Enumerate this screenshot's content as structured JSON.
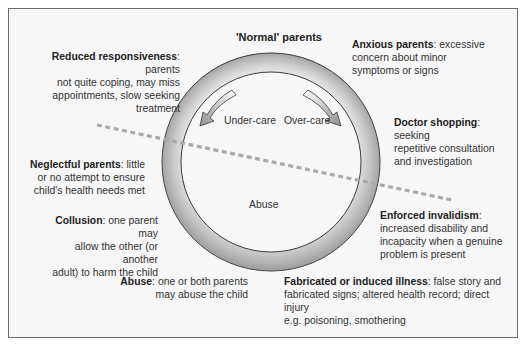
{
  "diagram": {
    "top_title": "'Normal' parents",
    "arrows": {
      "under_care": "Under-care",
      "over_care": "Over-care"
    },
    "center_label": "Abuse",
    "boxes": [
      {
        "id": "reduced",
        "title": "Reduced responsiveness",
        "text": ": parents not quite coping, may miss appointments, slow seeking treatment",
        "lines": [
          "not quite coping, may miss",
          "appointments, slow seeking treatment"
        ],
        "first_line_rest": ": parents"
      },
      {
        "id": "anxious",
        "title": "Anxious parents",
        "first_line_rest": ": excessive",
        "lines": [
          "concern about minor",
          "symptoms or signs"
        ]
      },
      {
        "id": "doctor",
        "title": "Doctor shopping",
        "first_line_rest": ": seeking",
        "lines": [
          "repetitive consultation",
          "and investigation"
        ]
      },
      {
        "id": "neglect",
        "title": "Neglectful parents",
        "first_line_rest": ": little",
        "lines": [
          "or no attempt to ensure",
          "child's health needs met"
        ]
      },
      {
        "id": "collusion",
        "title": "Collusion",
        "first_line_rest": ": one parent may",
        "lines": [
          "allow the other (or another",
          "adult) to harm the child"
        ]
      },
      {
        "id": "abuse",
        "title": "Abuse",
        "first_line_rest": ": one or both parents",
        "lines": [
          "may abuse the child"
        ]
      },
      {
        "id": "enforced",
        "title": "Enforced invalidism",
        "first_line_rest": ":",
        "lines": [
          "increased disability and",
          "incapacity when a genuine",
          "problem is present"
        ]
      },
      {
        "id": "fabricated",
        "title": "Fabricated or induced illness",
        "first_line_rest": ": false story and",
        "lines": [
          "fabricated signs; altered health record; direct injury",
          "e.g. poisoning, smothering"
        ]
      }
    ],
    "colors": {
      "ring_light": "#f2f2f2",
      "ring_dark": "#a8a8a8",
      "outline": "#3a3a3a",
      "dashed_line": "#a9a9a9",
      "frame_bg": "#f7f7f7",
      "frame_border": "#6a6a6a"
    }
  }
}
